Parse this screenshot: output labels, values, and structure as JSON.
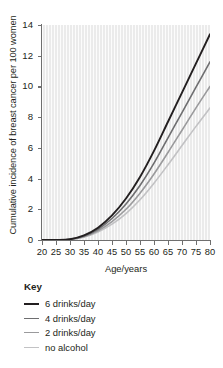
{
  "chart_data": {
    "type": "line",
    "title": "",
    "xlabel": "Age/years",
    "ylabel": "Cumulative incidence of breast cancer per 100 women",
    "xlim": [
      20,
      80
    ],
    "ylim": [
      0,
      14
    ],
    "xticks": [
      20,
      25,
      30,
      35,
      40,
      45,
      50,
      55,
      60,
      65,
      70,
      75,
      80
    ],
    "yticks": [
      0,
      2,
      4,
      6,
      8,
      10,
      12,
      14
    ],
    "grid": "vertical-faint",
    "legend_position": "below-plot",
    "legend_title": "Key",
    "plot_background": "#ebebeb",
    "series": [
      {
        "name": "6 drinks/day",
        "color": "#231f20",
        "width": 1.9,
        "x": [
          20,
          25,
          30,
          35,
          40,
          45,
          50,
          55,
          60,
          65,
          70,
          75,
          80
        ],
        "values": [
          0,
          0,
          0.05,
          0.3,
          0.8,
          1.6,
          2.7,
          4.1,
          5.8,
          7.7,
          9.6,
          11.5,
          13.4
        ]
      },
      {
        "name": "4 drinks/day",
        "color": "#6e6e70",
        "width": 1.6,
        "x": [
          20,
          25,
          30,
          35,
          40,
          45,
          50,
          55,
          60,
          65,
          70,
          75,
          80
        ],
        "values": [
          0,
          0,
          0.04,
          0.26,
          0.7,
          1.4,
          2.35,
          3.55,
          5.0,
          6.65,
          8.3,
          9.95,
          11.6
        ]
      },
      {
        "name": "2 drinks/day",
        "color": "#9a9a9c",
        "width": 1.6,
        "x": [
          20,
          25,
          30,
          35,
          40,
          45,
          50,
          55,
          60,
          65,
          70,
          75,
          80
        ],
        "values": [
          0,
          0,
          0.035,
          0.22,
          0.6,
          1.2,
          2.0,
          3.05,
          4.3,
          5.7,
          7.15,
          8.6,
          10.0
        ]
      },
      {
        "name": "no alcohol",
        "color": "#c2c2c4",
        "width": 1.6,
        "x": [
          20,
          25,
          30,
          35,
          40,
          45,
          50,
          55,
          60,
          65,
          70,
          75,
          80
        ],
        "values": [
          0,
          0,
          0.03,
          0.19,
          0.52,
          1.03,
          1.72,
          2.62,
          3.7,
          4.9,
          6.15,
          7.4,
          8.6
        ]
      }
    ]
  }
}
